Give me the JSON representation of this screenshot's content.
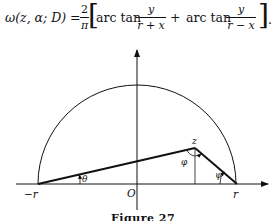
{
  "formula": {
    "lhs": "ω(z, α; D) =",
    "coef_num": "2",
    "coef_den": "π",
    "term1_func": "arc tan",
    "term1_num": "y",
    "term1_den": "r + x",
    "plus": "+",
    "term2_func": "arc tan",
    "term2_num": "y",
    "term2_den": "r − x",
    "end": "]."
  },
  "figure": {
    "labels": {
      "minus_r": "−r",
      "origin": "O",
      "r": "r",
      "z": "z",
      "theta": "θ",
      "phi": "φ",
      "psi": "ψ"
    },
    "caption": "Figure 27"
  }
}
